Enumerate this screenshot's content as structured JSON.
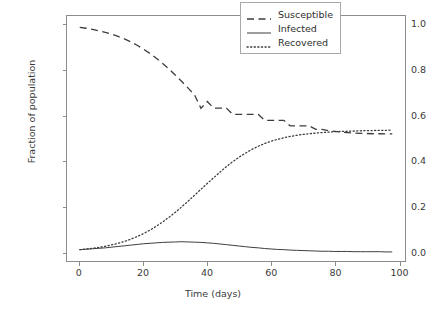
{
  "chart_data": {
    "type": "line",
    "title": "",
    "xlabel": "Time (days)",
    "ylabel": "Fraction of population",
    "xlim": [
      -4,
      102
    ],
    "ylim": [
      -0.04,
      1.04
    ],
    "xticks": [
      "0",
      "20",
      "40",
      "60",
      "80",
      "100"
    ],
    "xtick_values": [
      0,
      20,
      40,
      60,
      80,
      100
    ],
    "yticks": [
      "0.0",
      "0.2",
      "0.4",
      "0.6",
      "0.8",
      "1.0"
    ],
    "ytick_values": [
      0.0,
      0.2,
      0.4,
      0.6,
      0.8,
      1.0
    ],
    "grid": false,
    "legend_position": "upper right",
    "line_color": "#3c3c3c",
    "x": [
      0,
      2,
      4,
      6,
      8,
      10,
      12,
      14,
      16,
      18,
      20,
      22,
      24,
      26,
      28,
      30,
      32,
      34,
      36,
      38,
      40,
      42,
      44,
      46,
      48,
      50,
      52,
      54,
      56,
      58,
      60,
      62,
      64,
      66,
      68,
      70,
      72,
      74,
      76,
      78,
      80,
      82,
      84,
      86,
      88,
      90,
      92,
      94,
      96,
      98
    ],
    "series": [
      {
        "name": "Susceptible",
        "linestyle": "dashed",
        "values": [
          0.99,
          0.986,
          0.981,
          0.975,
          0.968,
          0.96,
          0.95,
          0.939,
          0.926,
          0.911,
          0.894,
          0.875,
          0.854,
          0.831,
          0.806,
          0.779,
          0.751,
          0.722,
          0.692,
          0.633,
          0.663,
          0.634,
          0.634,
          0.634,
          0.606,
          0.606,
          0.606,
          0.606,
          0.606,
          0.58,
          0.58,
          0.58,
          0.58,
          0.556,
          0.556,
          0.556,
          0.556,
          0.54,
          0.54,
          0.534,
          0.531,
          0.528,
          0.526,
          0.524,
          0.523,
          0.522,
          0.521,
          0.521,
          0.52,
          0.52
        ]
      },
      {
        "name": "Infected",
        "linestyle": "solid",
        "values": [
          0.01,
          0.012,
          0.014,
          0.016,
          0.018,
          0.021,
          0.024,
          0.027,
          0.03,
          0.033,
          0.036,
          0.038,
          0.04,
          0.042,
          0.043,
          0.044,
          0.045,
          0.044,
          0.043,
          0.042,
          0.04,
          0.038,
          0.035,
          0.032,
          0.029,
          0.026,
          0.023,
          0.02,
          0.018,
          0.015,
          0.013,
          0.011,
          0.01,
          0.008,
          0.007,
          0.006,
          0.005,
          0.004,
          0.003,
          0.003,
          0.002,
          0.002,
          0.002,
          0.001,
          0.001,
          0.001,
          0.001,
          0.001,
          0.0,
          0.0
        ]
      },
      {
        "name": "Recovered",
        "linestyle": "dotted",
        "values": [
          0.01,
          0.013,
          0.016,
          0.02,
          0.025,
          0.031,
          0.038,
          0.046,
          0.056,
          0.068,
          0.081,
          0.096,
          0.113,
          0.132,
          0.153,
          0.175,
          0.199,
          0.224,
          0.25,
          0.276,
          0.302,
          0.327,
          0.352,
          0.376,
          0.398,
          0.418,
          0.436,
          0.452,
          0.466,
          0.478,
          0.488,
          0.496,
          0.503,
          0.509,
          0.514,
          0.518,
          0.521,
          0.524,
          0.526,
          0.528,
          0.53,
          0.531,
          0.532,
          0.533,
          0.534,
          0.535,
          0.535,
          0.536,
          0.536,
          0.537
        ]
      }
    ]
  },
  "legend": {
    "entries": [
      {
        "label": "Susceptible",
        "style": "dashed"
      },
      {
        "label": "Infected",
        "style": "solid"
      },
      {
        "label": "Recovered",
        "style": "dotted"
      }
    ]
  },
  "axes": {
    "x_axis_label": "Time (days)",
    "y_axis_label": "Fraction of population"
  }
}
